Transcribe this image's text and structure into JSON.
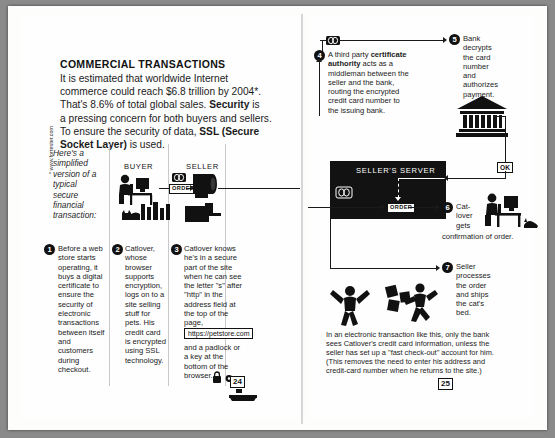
{
  "spread": {
    "side_note": "* www.forrester.com",
    "page_number_left": "24",
    "page_number_right": "25"
  },
  "left": {
    "heading": "COMMERCIAL TRANSACTIONS",
    "intro_lines": [
      "It is estimated that worldwide Internet",
      "commerce could reach $6.8 trillion by 2004*.",
      "That's 8.6% of total global sales. Security is",
      "a pressing concern for both buyers and sellers.",
      "To ensure the security of data, SSL (Secure",
      "Socket Layer) is used."
    ],
    "intro_bold_terms": [
      "Security",
      "SSL (Secure Socket Layer)"
    ],
    "caption_italic": "Here's a simplified version of a typical secure financial transaction:",
    "diagram_labels": {
      "buyer": "BUYER",
      "seller": "SELLER",
      "order_chip": "ORDER"
    },
    "steps": [
      {
        "number": "1",
        "text": "Before a web store starts operating, it buys a digital certificate to ensure the security of electronic transactions between itself and customers during checkout."
      },
      {
        "number": "2",
        "text": "Catlover, whose browser supports encryption, logs on to a site selling stuff for pets. His credit card is encrypted using SSL technology."
      },
      {
        "number": "3",
        "text_before_url": "Catlover knows he's in a secure part of the site when he can see the letter \"s\" after \"http\" in the address field at the top of the page,",
        "url": "https://petstore.com",
        "text_after_url": "and a padlock or a key at the bottom of the browser."
      }
    ]
  },
  "right": {
    "server_label": "SELLER'S SERVER",
    "server_order_chip": "ORDER",
    "ok_chip": "OK",
    "steps": [
      {
        "number": "4",
        "text_a": "A third party ",
        "text_bold": "certificate authority",
        "text_b": " acts as a middleman between the seller and the bank, routing the encrypted credit card number to the issuing bank."
      },
      {
        "number": "5",
        "text": "Bank decrypts the card number and authorizes payment."
      },
      {
        "number": "6",
        "text": "Cat-lover gets confirmation of order."
      },
      {
        "number": "7",
        "text": "Seller processes the order and ships the cat's bed."
      }
    ],
    "footnote_lines": [
      "In an electronic transaction like this, only the bank",
      "sees Catlover's credit card information, unless the",
      "seller has set up a \"fast check-out\" account for him.",
      "(This removes the need to enter his address and",
      "credit-card number when he returns to the site.)"
    ]
  },
  "colors": {
    "ink": "#111111",
    "paper": "#fefefe",
    "backdrop": "#8a8a8a",
    "rule": "#c9c9c9"
  }
}
